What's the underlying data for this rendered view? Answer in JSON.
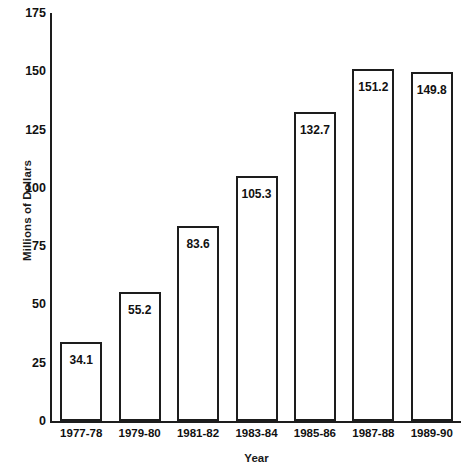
{
  "chart_data": {
    "type": "bar",
    "title": "",
    "xlabel": "Year",
    "ylabel": "Millions of Dollars",
    "categories": [
      "1977-78",
      "1979-80",
      "1981-82",
      "1983-84",
      "1985-86",
      "1987-88",
      "1989-90"
    ],
    "values": [
      34.1,
      55.2,
      83.6,
      105.3,
      132.7,
      151.2,
      149.8
    ],
    "value_labels": [
      "34.1",
      "55.2",
      "83.6",
      "105.3",
      "132.7",
      "151.2",
      "149.8"
    ],
    "ylim": [
      0,
      175
    ],
    "ytick_labels": [
      "0",
      "25",
      "50",
      "75",
      "100",
      "125",
      "150",
      "175"
    ],
    "ytick_values": [
      0,
      25,
      50,
      75,
      100,
      125,
      150,
      175
    ],
    "grid": false,
    "legend": false,
    "bar_fill_color": "#ffffff",
    "bar_edge_color": "#1d1d1d",
    "axis_color": "#1d1d1d",
    "text_color": "#111111",
    "background_color": "#ffffff"
  }
}
